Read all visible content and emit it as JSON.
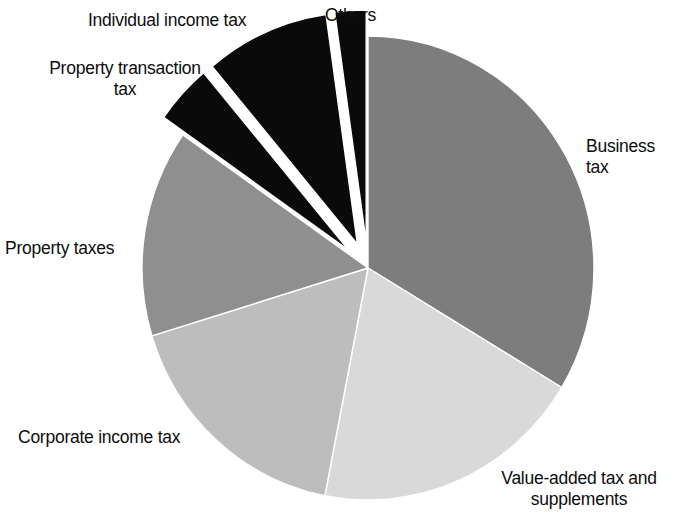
{
  "chart_data": {
    "type": "pie",
    "title": "",
    "subtitle": "",
    "xlabel": "",
    "ylabel": "",
    "legend_position": "none",
    "labels_position": "outside-callout",
    "grid": false,
    "units": "percent",
    "categories": [
      "Business tax",
      "Value-added tax and supplements",
      "Corporate income tax",
      "Property taxes",
      "Individual income tax",
      "Property transaction tax",
      "Others"
    ],
    "values": [
      33.6,
      19.4,
      17.2,
      14.4,
      4.2,
      8.9,
      2.3
    ],
    "series": [
      {
        "name": "Tax revenue composition",
        "values": [
          33.6,
          19.4,
          17.2,
          14.4,
          4.2,
          8.9,
          2.3
        ]
      }
    ],
    "slices": [
      {
        "label": "Business tax",
        "value": 33.6,
        "start_angle_deg": 0.0,
        "end_angle_deg": 121.0,
        "color": "#7d7d7d",
        "exploded": false,
        "label_x": 586,
        "label_y": 136
      },
      {
        "label": "Value-added tax and supplements",
        "value": 19.4,
        "start_angle_deg": 121.0,
        "end_angle_deg": 191.0,
        "color": "#d9d9d9",
        "exploded": false,
        "label_x": 481,
        "label_y": 468
      },
      {
        "label": "Corporate income tax",
        "value": 17.2,
        "start_angle_deg": 191.0,
        "end_angle_deg": 253.0,
        "color": "#bdbdbd",
        "exploded": false,
        "label_x": 18,
        "label_y": 427
      },
      {
        "label": "Property taxes",
        "value": 14.4,
        "start_angle_deg": 253.0,
        "end_angle_deg": 305.0,
        "color": "#8f8f8f",
        "exploded": false,
        "label_x": 5,
        "label_y": 238
      },
      {
        "label": "Individual income tax",
        "value": 4.2,
        "start_angle_deg": 305.0,
        "end_angle_deg": 320.0,
        "color": "#0a0a0a",
        "exploded": true,
        "label_x": 88,
        "label_y": 10
      },
      {
        "label": "Property transaction tax",
        "value": 8.9,
        "start_angle_deg": 320.0,
        "end_angle_deg": 352.0,
        "color": "#0a0a0a",
        "exploded": true,
        "label_x": 41,
        "label_y": 58
      },
      {
        "label": "Others",
        "value": 2.3,
        "start_angle_deg": 352.0,
        "end_angle_deg": 360.0,
        "color": "#0a0a0a",
        "exploded": true,
        "label_x": 325,
        "label_y": 5
      }
    ],
    "geometry": {
      "center_x": 368,
      "center_y": 268,
      "radius_x": 226,
      "radius_y": 232
    }
  },
  "labels": {
    "business_tax": "Business tax",
    "value_added_tax": "Value-added tax and\nsupplements",
    "corporate_income_tax": "Corporate income tax",
    "property_taxes": "Property taxes",
    "property_transaction_tax": "Property transaction\ntax",
    "individual_income_tax": "Individual income tax",
    "others": "Others"
  },
  "colors": {
    "background": "#ffffff",
    "text": "#0d0d0d",
    "business_tax": "#7d7d7d",
    "value_added_tax": "#d9d9d9",
    "corporate_income_tax": "#bdbdbd",
    "property_taxes": "#8f8f8f",
    "black_slices": "#0a0a0a",
    "slice_border": "#ffffff"
  }
}
